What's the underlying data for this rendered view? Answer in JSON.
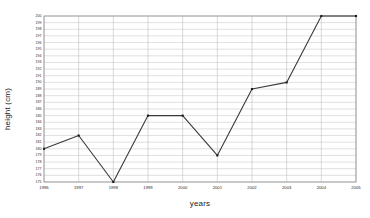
{
  "chart_data": {
    "type": "line",
    "title": "",
    "xlabel": "years",
    "ylabel": "height (cm)",
    "categories": [
      "1996",
      "1997",
      "1998",
      "1999",
      "2000",
      "2001",
      "2002",
      "2003",
      "2004",
      "2005"
    ],
    "values": [
      180,
      182,
      175,
      185,
      185,
      179,
      189,
      190,
      200,
      200
    ],
    "series": [
      {
        "name": "height",
        "values": [
          180,
          182,
          175,
          185,
          185,
          179,
          189,
          190,
          200,
          200
        ]
      }
    ],
    "ylim": [
      175,
      200
    ],
    "ytick_step": 1,
    "yticks": [
      200,
      199,
      198,
      197,
      196,
      195,
      194,
      193,
      192,
      191,
      190,
      189,
      188,
      187,
      186,
      185,
      184,
      183,
      182,
      181,
      180,
      179,
      178,
      177,
      176,
      175
    ],
    "xticks": [
      "1996",
      "1997",
      "1998",
      "1999",
      "2000",
      "2001",
      "2002",
      "2003",
      "2004",
      "2005"
    ],
    "grid": {
      "horizontal": true,
      "vertical": true,
      "color": "#b9b9b9"
    },
    "legend": {
      "visible": false,
      "position": "none",
      "entries": []
    },
    "marker": "square",
    "line_color": "#3a3a3a",
    "marker_color": "#1c1c1c",
    "background_color": "#ffffff",
    "frame_color": "#8f8f8f"
  }
}
